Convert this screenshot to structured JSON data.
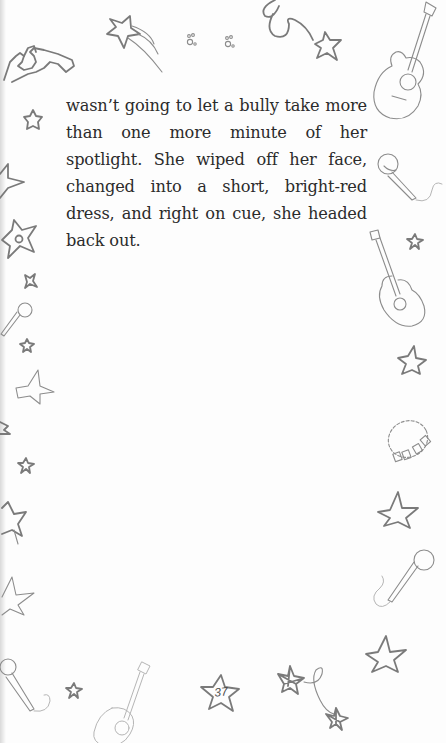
{
  "page": {
    "body_text": "wasn’t going to let a bully take more than one more minute of her spotlight. She wiped off her face, changed into a short, bright-red dress, and right on cue, she headed back out.",
    "page_number": "37"
  },
  "decorations": [
    "heart-hands-icon",
    "shooting-star-icon",
    "paw-print-icon",
    "paw-print-icon",
    "swirl-star-icon",
    "guitar-icon",
    "microphone-icon",
    "guitar-icon",
    "star-icon",
    "bead-bracelet-icon",
    "star-icon",
    "microphone-icon",
    "star-icon",
    "linked-stars-icon",
    "page-number-star-icon",
    "guitar-icon",
    "microphone-icon",
    "star-icon"
  ],
  "colors": {
    "ink": "#7a7a7a",
    "text": "#2b2b2b",
    "background": "#fdfdfd"
  }
}
